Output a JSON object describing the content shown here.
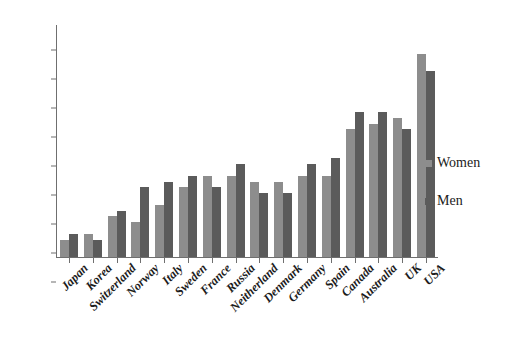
{
  "chart_data": {
    "type": "bar",
    "title": "",
    "xlabel": "",
    "ylabel": "",
    "ylim": [
      0,
      40
    ],
    "ytick_step": 5,
    "yticks": [
      40,
      35,
      30,
      25,
      20,
      15,
      10,
      5,
      0
    ],
    "grid": false,
    "legend_position": "right",
    "categories": [
      "Japan",
      "Korea",
      "Switzerland",
      "Norway",
      "Italy",
      "Sweden",
      "France",
      "Russia",
      "Neitherland",
      "Denmark",
      "Germany",
      "Spain",
      "Canada",
      "Australia",
      "UK",
      "USA"
    ],
    "series": [
      {
        "name": "Women",
        "color": "#8d8d8d",
        "values": [
          3,
          4,
          7,
          6,
          9,
          12,
          14,
          14,
          13,
          13,
          14,
          14,
          22,
          23,
          24,
          35
        ]
      },
      {
        "name": "Men",
        "color": "#5b5b5b",
        "values": [
          4,
          3,
          8,
          12,
          13,
          14,
          12,
          16,
          11,
          11,
          16,
          17,
          25,
          25,
          22,
          32
        ]
      }
    ]
  },
  "legend": {
    "items": [
      {
        "label": "Women",
        "color": "#8d8d8d"
      },
      {
        "label": "Men",
        "color": "#5b5b5b"
      }
    ]
  }
}
